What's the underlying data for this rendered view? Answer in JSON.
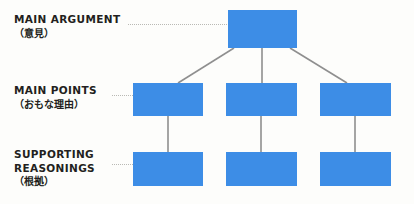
{
  "diagram": {
    "background_color": "#fdfdfb",
    "node_color": "#3d8de6",
    "connector_color": "#8f8f8f",
    "leader_color": "#b9b9b4",
    "text_color": "#231f20",
    "tiers": [
      {
        "id": "main-argument",
        "label_en": "MAIN ARGUMENT",
        "label_ja": "（意見）",
        "node_count": 1
      },
      {
        "id": "main-points",
        "label_en": "MAIN POINTS",
        "label_ja": "（おもな理由）",
        "node_count": 3
      },
      {
        "id": "supporting-reasonings",
        "label_en": "SUPPORTING REASONINGS",
        "label_en_line1": "SUPPORTING",
        "label_en_line2": "REASONINGS",
        "label_ja": "（根拠）",
        "node_count": 3
      }
    ],
    "nodes": {
      "argument": {
        "label": ""
      },
      "point_1": {
        "label": ""
      },
      "point_2": {
        "label": ""
      },
      "point_3": {
        "label": ""
      },
      "reason_1": {
        "label": ""
      },
      "reason_2": {
        "label": ""
      },
      "reason_3": {
        "label": ""
      }
    }
  }
}
